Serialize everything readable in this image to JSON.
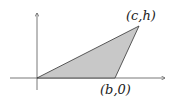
{
  "diagram": {
    "type": "triangle-on-axes",
    "fill_color": "#c8c8c8",
    "stroke_color": "#333333",
    "axis_color": "#555555",
    "vertices": {
      "origin": {
        "label": ""
      },
      "base": {
        "label": "(b,0)"
      },
      "apex": {
        "label": "(c,h)"
      }
    }
  }
}
